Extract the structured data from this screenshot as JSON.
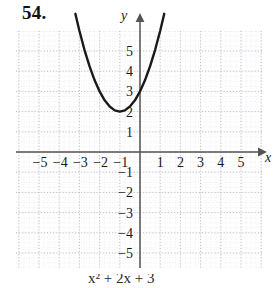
{
  "problem": {
    "number_label": "54."
  },
  "chart_data": {
    "type": "line",
    "title": "",
    "subtitle": "",
    "xlabel": "x",
    "ylabel": "y",
    "grid": true,
    "grid_step": 1,
    "minor_grid": true,
    "legend_position": "none",
    "xlim": [
      -6.2,
      6.2
    ],
    "ylim": [
      -6.2,
      6.2
    ],
    "x_tick_labels": [
      "-5",
      "-4",
      "-3",
      "-2",
      "-1",
      "1",
      "2",
      "3",
      "4",
      "5"
    ],
    "x_ticks": [
      -5,
      -4,
      -3,
      -2,
      -1,
      1,
      2,
      3,
      4,
      5
    ],
    "y_tick_labels": [
      "5",
      "4",
      "3",
      "2",
      "1",
      "-1",
      "-2",
      "-3",
      "-4",
      "-5"
    ],
    "y_ticks": [
      5,
      4,
      3,
      2,
      1,
      -1,
      -2,
      -3,
      -4,
      -5
    ],
    "axis_arrows": [
      "x-positive",
      "y-positive"
    ],
    "curve": {
      "name": "parabola",
      "shape": "upward parabola",
      "vertex": [
        -1,
        2
      ],
      "equation": "y = x^2 + 2x + 3",
      "color": "#1a1a1a",
      "line_width": 2.4,
      "x_start": -3.2,
      "x_end": 1.2,
      "points": [
        [
          -3.2,
          6.84
        ],
        [
          -3.0,
          6.0
        ],
        [
          -2.75,
          5.06
        ],
        [
          -2.5,
          4.25
        ],
        [
          -2.25,
          3.56
        ],
        [
          -2.0,
          3.0
        ],
        [
          -1.75,
          2.56
        ],
        [
          -1.5,
          2.25
        ],
        [
          -1.25,
          2.06
        ],
        [
          -1.0,
          2.0
        ],
        [
          -0.75,
          2.06
        ],
        [
          -0.5,
          2.25
        ],
        [
          -0.25,
          2.56
        ],
        [
          0.0,
          3.0
        ],
        [
          0.25,
          3.56
        ],
        [
          0.5,
          4.25
        ],
        [
          0.75,
          5.06
        ],
        [
          1.0,
          6.0
        ],
        [
          1.2,
          6.84
        ]
      ]
    }
  },
  "equation_caption": {
    "text": "y = x2 + 2x + 3",
    "visible_fragment": "x² + 2x + 3"
  },
  "colors": {
    "curve": "#1a1a1a",
    "axis": "#555555",
    "grid_major": "#b9b9c6",
    "grid_minor": "#dcdce4",
    "text": "#1a1a1a",
    "background": "#ffffff"
  }
}
